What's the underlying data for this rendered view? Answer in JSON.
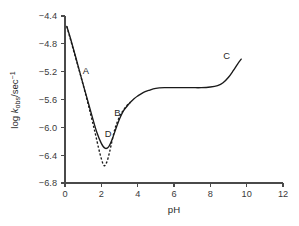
{
  "chart_data": {
    "type": "line",
    "title": "",
    "xlabel": "pH",
    "ylabel": "log k_obs/sec^-1",
    "ylabel_parts": {
      "prefix": "log ",
      "italic": "k",
      "subscript": "obs",
      "middle": "/sec",
      "superscript": "−1"
    },
    "xlim": [
      0,
      12
    ],
    "ylim": [
      -6.8,
      -4.4
    ],
    "xticks": [
      0,
      2,
      4,
      6,
      8,
      10,
      12
    ],
    "xticklabels": [
      "0",
      "2",
      "4",
      "6",
      "8",
      "10",
      "12"
    ],
    "yticks": [
      -6.8,
      -6.4,
      -6.0,
      -5.6,
      -5.2,
      -4.8,
      -4.4
    ],
    "yticklabels": [
      "−6.8",
      "−6.4",
      "−6.0",
      "−5.6",
      "−5.2",
      "−4.8",
      "−4.4"
    ],
    "grid": false,
    "legend": "none",
    "series": [
      {
        "name": "observed rate profile (solid)",
        "style": "solid",
        "color": "#1a1a1a",
        "x": [
          0.1,
          0.3,
          0.6,
          0.9,
          1.2,
          1.5,
          1.75,
          2.0,
          2.2,
          2.4,
          2.6,
          2.8,
          3.0,
          3.2,
          3.4,
          3.6,
          3.8,
          4.0,
          4.3,
          4.6,
          5.0,
          5.5,
          6.0,
          6.5,
          7.0,
          7.5,
          8.0,
          8.4,
          8.7,
          9.0,
          9.25,
          9.5,
          9.7
        ],
        "y": [
          -4.55,
          -4.72,
          -5.0,
          -5.29,
          -5.57,
          -5.85,
          -6.07,
          -6.23,
          -6.3,
          -6.28,
          -6.17,
          -6.02,
          -5.88,
          -5.77,
          -5.7,
          -5.64,
          -5.59,
          -5.55,
          -5.5,
          -5.47,
          -5.44,
          -5.43,
          -5.43,
          -5.43,
          -5.43,
          -5.43,
          -5.42,
          -5.4,
          -5.36,
          -5.28,
          -5.19,
          -5.09,
          -5.02
        ]
      },
      {
        "name": "uncorrected rate profile (dashed)",
        "style": "dashed",
        "color": "#1a1a1a",
        "x": [
          0.1,
          0.4,
          0.8,
          1.1,
          1.4,
          1.65,
          1.85,
          2.0,
          2.15,
          2.3,
          2.45,
          2.6,
          2.75,
          2.9,
          3.05,
          3.2,
          3.4,
          3.6
        ],
        "y": [
          -4.55,
          -4.83,
          -5.2,
          -5.49,
          -5.8,
          -6.07,
          -6.3,
          -6.45,
          -6.55,
          -6.5,
          -6.36,
          -6.18,
          -6.02,
          -5.91,
          -5.82,
          -5.76,
          -5.69,
          -5.64
        ]
      }
    ],
    "annotations": [
      {
        "label": "A",
        "x": 1.15,
        "y": -5.23
      },
      {
        "label": "B",
        "x": 2.88,
        "y": -5.84
      },
      {
        "label": "C",
        "x": 8.9,
        "y": -5.02
      },
      {
        "label": "D",
        "x": 2.38,
        "y": -6.14
      }
    ]
  }
}
